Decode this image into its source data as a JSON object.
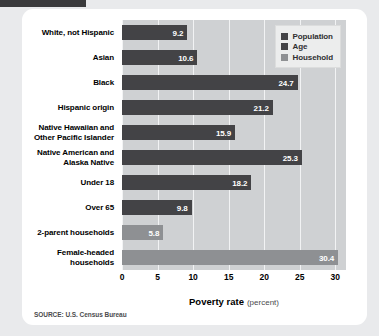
{
  "source_note": "SOURCE: U.S. Census Bureau",
  "legend": {
    "items": [
      {
        "label": "Population",
        "color": "#434346",
        "key": "population"
      },
      {
        "label": "Age",
        "color": "#434346",
        "key": "age"
      },
      {
        "label": "Household",
        "color": "#8e9093",
        "key": "household"
      }
    ]
  },
  "axis": {
    "title_main": "Poverty rate",
    "title_unit": "(percent)"
  },
  "chart_data": {
    "type": "bar",
    "orientation": "horizontal",
    "title": "",
    "subtitle": "",
    "xlabel": "Poverty rate (percent)",
    "ylabel": "",
    "xlim": [
      0,
      31.5
    ],
    "ticks": [
      "0",
      "5",
      "10",
      "15",
      "20",
      "25",
      "30"
    ],
    "tick_values": [
      0,
      5,
      10,
      15,
      20,
      25,
      30
    ],
    "grid": true,
    "legend_position": "top-right",
    "categories": [
      "White, not Hispanic",
      "Asian",
      "Black",
      "Hispanic origin",
      "Native Hawaiian and Other Pacific Islander",
      "Native American and Alaska Native",
      "Under 18",
      "Over 65",
      "2-parent households",
      "Female-headed households"
    ],
    "category_lines": [
      [
        "White, not Hispanic"
      ],
      [
        "Asian"
      ],
      [
        "Black"
      ],
      [
        "Hispanic origin"
      ],
      [
        "Native Hawaiian and",
        "Other Pacific Islander"
      ],
      [
        "Native American and",
        "Alaska Native"
      ],
      [
        "Under 18"
      ],
      [
        "Over 65"
      ],
      [
        "2-parent households"
      ],
      [
        "Female-headed",
        "households"
      ]
    ],
    "values": [
      9.2,
      10.6,
      24.7,
      21.2,
      15.9,
      25.3,
      18.2,
      9.8,
      5.8,
      30.4
    ],
    "value_labels": [
      "9.2",
      "10.6",
      "24.7",
      "21.2",
      "15.9",
      "25.3",
      "18.2",
      "9.8",
      "5.8",
      "30.4"
    ],
    "groups": [
      "population",
      "population",
      "population",
      "population",
      "population",
      "population",
      "age",
      "age",
      "household",
      "household"
    ],
    "series": [
      {
        "name": "Population",
        "color": "#434346",
        "points": [
          {
            "category": "White, not Hispanic",
            "value": 9.2
          },
          {
            "category": "Asian",
            "value": 10.6
          },
          {
            "category": "Black",
            "value": 24.7
          },
          {
            "category": "Hispanic origin",
            "value": 21.2
          },
          {
            "category": "Native Hawaiian and Other Pacific Islander",
            "value": 15.9
          },
          {
            "category": "Native American and Alaska Native",
            "value": 25.3
          }
        ]
      },
      {
        "name": "Age",
        "color": "#434346",
        "points": [
          {
            "category": "Under 18",
            "value": 18.2
          },
          {
            "category": "Over 65",
            "value": 9.8
          }
        ]
      },
      {
        "name": "Household",
        "color": "#8e9093",
        "points": [
          {
            "category": "2-parent households",
            "value": 5.8
          },
          {
            "category": "Female-headed households",
            "value": 30.4
          }
        ]
      }
    ]
  }
}
